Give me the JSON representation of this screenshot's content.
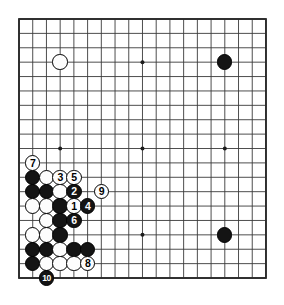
{
  "diagram": {
    "type": "go-board-diagram",
    "board_size": 19,
    "board_label": "Go board 19x19",
    "background_color": "#ffffff",
    "line_color": "#3a3a3a",
    "border_color": "#2b2b2b",
    "black_color": "#141414",
    "white_color": "#fdfdfd",
    "geometry": {
      "left": 19,
      "top": 19,
      "cell_w": 13.72,
      "cell_h": 14.39,
      "stone_d": 15.4
    },
    "star_points": [
      {
        "col": 3,
        "row": 3
      },
      {
        "col": 9,
        "row": 3
      },
      {
        "col": 15,
        "row": 3
      },
      {
        "col": 3,
        "row": 9
      },
      {
        "col": 9,
        "row": 9
      },
      {
        "col": 15,
        "row": 9
      },
      {
        "col": 3,
        "row": 15
      },
      {
        "col": 9,
        "row": 15
      },
      {
        "col": 15,
        "row": 15
      }
    ],
    "stones": [
      {
        "col": 3,
        "row": 3,
        "color": "white",
        "label": ""
      },
      {
        "col": 15,
        "row": 3,
        "color": "black",
        "label": ""
      },
      {
        "col": 15,
        "row": 15,
        "color": "black",
        "label": ""
      },
      {
        "col": 1,
        "row": 10,
        "color": "white",
        "label": "7"
      },
      {
        "col": 1,
        "row": 11,
        "color": "black",
        "label": ""
      },
      {
        "col": 2,
        "row": 11,
        "color": "white",
        "label": ""
      },
      {
        "col": 3,
        "row": 11,
        "color": "white",
        "label": "3"
      },
      {
        "col": 4,
        "row": 11,
        "color": "white",
        "label": "5"
      },
      {
        "col": 1,
        "row": 12,
        "color": "black",
        "label": ""
      },
      {
        "col": 2,
        "row": 12,
        "color": "black",
        "label": ""
      },
      {
        "col": 3,
        "row": 12,
        "color": "white",
        "label": ""
      },
      {
        "col": 4,
        "row": 12,
        "color": "black",
        "label": "2"
      },
      {
        "col": 6,
        "row": 12,
        "color": "white",
        "label": "9"
      },
      {
        "col": 1,
        "row": 13,
        "color": "white",
        "label": ""
      },
      {
        "col": 2,
        "row": 13,
        "color": "white",
        "label": ""
      },
      {
        "col": 3,
        "row": 13,
        "color": "black",
        "label": ""
      },
      {
        "col": 4,
        "row": 13,
        "color": "white",
        "label": "1"
      },
      {
        "col": 5,
        "row": 13,
        "color": "black",
        "label": "4"
      },
      {
        "col": 2,
        "row": 14,
        "color": "white",
        "label": ""
      },
      {
        "col": 3,
        "row": 14,
        "color": "black",
        "label": ""
      },
      {
        "col": 4,
        "row": 14,
        "color": "black",
        "label": "6"
      },
      {
        "col": 1,
        "row": 15,
        "color": "white",
        "label": ""
      },
      {
        "col": 2,
        "row": 15,
        "color": "white",
        "label": ""
      },
      {
        "col": 3,
        "row": 15,
        "color": "black",
        "label": ""
      },
      {
        "col": 1,
        "row": 16,
        "color": "black",
        "label": ""
      },
      {
        "col": 2,
        "row": 16,
        "color": "black",
        "label": ""
      },
      {
        "col": 3,
        "row": 16,
        "color": "white",
        "label": ""
      },
      {
        "col": 4,
        "row": 16,
        "color": "black",
        "label": ""
      },
      {
        "col": 5,
        "row": 16,
        "color": "black",
        "label": ""
      },
      {
        "col": 1,
        "row": 17,
        "color": "black",
        "label": ""
      },
      {
        "col": 2,
        "row": 17,
        "color": "white",
        "label": ""
      },
      {
        "col": 3,
        "row": 17,
        "color": "white",
        "label": ""
      },
      {
        "col": 4,
        "row": 17,
        "color": "white",
        "label": ""
      },
      {
        "col": 5,
        "row": 17,
        "color": "white",
        "label": "8"
      },
      {
        "col": 2,
        "row": 18,
        "color": "black",
        "label": "10"
      }
    ],
    "move_sequence": [
      {
        "number": "1",
        "color": "white",
        "col": 4,
        "row": 13
      },
      {
        "number": "2",
        "color": "black",
        "col": 4,
        "row": 12
      },
      {
        "number": "3",
        "color": "white",
        "col": 3,
        "row": 11
      },
      {
        "number": "4",
        "color": "black",
        "col": 5,
        "row": 13
      },
      {
        "number": "5",
        "color": "white",
        "col": 4,
        "row": 11
      },
      {
        "number": "6",
        "color": "black",
        "col": 4,
        "row": 14
      },
      {
        "number": "7",
        "color": "white",
        "col": 1,
        "row": 10
      },
      {
        "number": "8",
        "color": "white",
        "col": 5,
        "row": 17
      },
      {
        "number": "9",
        "color": "white",
        "col": 6,
        "row": 12
      },
      {
        "number": "10",
        "color": "black",
        "col": 2,
        "row": 18
      }
    ]
  }
}
